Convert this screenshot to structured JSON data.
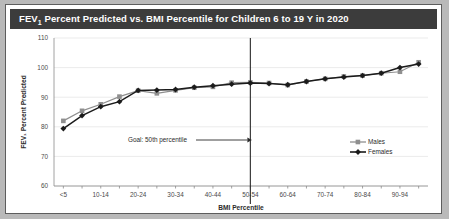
{
  "figure": {
    "title_prefix": "FEV",
    "title_sub": "1",
    "title_rest": " Percent Predicted vs. BMI Percentile for Children 6 to 19 Y in 2020"
  },
  "colors": {
    "title_bar": "#3c3c3c",
    "title_text": "#ffffff",
    "males": "#8f8f8f",
    "females": "#1b1b1b",
    "grid": "#e2e2e2",
    "axis": "#8a8a8a",
    "page_background": "#b9b9b9",
    "card_background": "#ffffff"
  },
  "chart_data": {
    "type": "line",
    "title": "FEV1 Percent Predicted vs. BMI Percentile for Children 6 to 19 Y in 2020",
    "xlabel": "BMI Percentile",
    "ylabel": "FEV1 Percent Predicted",
    "ylim": [
      60,
      110
    ],
    "yticks": [
      60,
      70,
      80,
      90,
      100,
      110
    ],
    "grid": true,
    "legend_position": "inside-right",
    "categories": [
      "<5",
      "5-9",
      "10-14",
      "15-19",
      "20-24",
      "25-29",
      "30-34",
      "35-39",
      "40-44",
      "45-49",
      "50-54",
      "55-59",
      "60-64",
      "65-69",
      "70-74",
      "75-79",
      "80-84",
      "85-89",
      "90-94",
      "95-99"
    ],
    "tick_labels": [
      "<5",
      "",
      "10-14",
      "",
      "20-24",
      "",
      "30-34",
      "",
      "40-44",
      "",
      "50-54",
      "",
      "60-64",
      "",
      "70-74",
      "",
      "80-84",
      "",
      "90-94",
      ""
    ],
    "series": [
      {
        "name": "Males",
        "marker": "square",
        "color": "#8f8f8f",
        "values": [
          82.0,
          85.4,
          87.6,
          90.2,
          92.2,
          91.3,
          92.3,
          93.2,
          93.5,
          94.9,
          95.0,
          94.8,
          94.1,
          95.3,
          96.2,
          97.0,
          97.3,
          98.1,
          98.6,
          101.8
        ]
      },
      {
        "name": "Females",
        "marker": "diamond",
        "color": "#1b1b1b",
        "values": [
          79.4,
          83.8,
          86.8,
          88.5,
          92.3,
          92.4,
          92.6,
          93.4,
          93.9,
          94.4,
          94.8,
          94.6,
          94.2,
          95.3,
          96.2,
          96.8,
          97.3,
          98.1,
          100.0,
          101.2
        ]
      }
    ],
    "annotations": [
      {
        "name": "goal-annotation",
        "text": "Goal: 50th percentile",
        "arrow": "right",
        "target_category": "50-54",
        "reference_line": true
      }
    ]
  },
  "legend": {
    "items": [
      {
        "label": "Males"
      },
      {
        "label": "Females"
      }
    ]
  }
}
